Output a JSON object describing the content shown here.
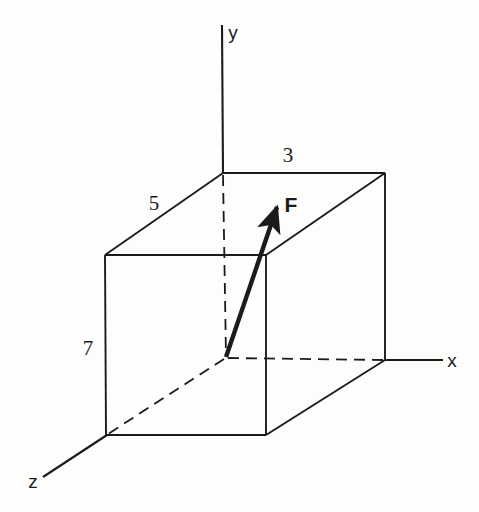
{
  "figure": {
    "kind": "engineering-line-drawing",
    "background_color": "#fdfdfc",
    "ink_color": "#1b1b1b",
    "width": 479,
    "height": 512
  },
  "axes": [
    {
      "id": "y",
      "label": "y",
      "label_x": 233,
      "label_y": 32,
      "direction": "up"
    },
    {
      "id": "x",
      "label": "x",
      "label_x": 452,
      "label_y": 360,
      "direction": "right"
    },
    {
      "id": "z",
      "label": "z",
      "label_x": 33,
      "label_y": 481,
      "direction": "down-left"
    }
  ],
  "dimensions": [
    {
      "id": "depth-z",
      "value": "5",
      "label_x": 154,
      "label_y": 203,
      "edge": "top-back-left-to-front-left"
    },
    {
      "id": "width-x",
      "value": "3",
      "label_x": 288,
      "label_y": 155,
      "edge": "top-back-left-to-back-right"
    },
    {
      "id": "height-y",
      "value": "7",
      "label_x": 88,
      "label_y": 348,
      "edge": "front-left-vertical"
    }
  ],
  "vector": {
    "id": "force-F",
    "label": "F",
    "label_x": 291,
    "label_y": 204,
    "tail_x": 226,
    "tail_y": 357,
    "tip_x": 280,
    "tip_y": 199
  },
  "geometry": {
    "vertices": {
      "origin": {
        "x": 226,
        "y": 358
      },
      "back_top_left": {
        "x": 223,
        "y": 173
      },
      "back_top_right": {
        "x": 385,
        "y": 173
      },
      "back_bottom_right": {
        "x": 385,
        "y": 360
      },
      "front_top_left": {
        "x": 105,
        "y": 255
      },
      "front_top_right": {
        "x": 266,
        "y": 255
      },
      "front_bottom_left": {
        "x": 106,
        "y": 435
      },
      "front_bottom_right": {
        "x": 266,
        "y": 435
      }
    },
    "axis_ends": {
      "y_axis_top": {
        "x": 222,
        "y": 25
      },
      "x_axis_right": {
        "x": 443,
        "y": 360
      },
      "z_axis_out": {
        "x": 43,
        "y": 477
      }
    },
    "solid_edges": [
      [
        "back_top_left",
        "back_top_right"
      ],
      [
        "back_top_left",
        "front_top_left"
      ],
      [
        "back_top_right",
        "front_top_right"
      ],
      [
        "back_top_right",
        "back_bottom_right"
      ],
      [
        "front_top_left",
        "front_top_right"
      ],
      [
        "front_top_left",
        "front_bottom_left"
      ],
      [
        "front_top_right",
        "front_bottom_right"
      ],
      [
        "front_bottom_left",
        "front_bottom_right"
      ],
      [
        "front_bottom_right",
        "back_bottom_right"
      ]
    ],
    "hidden_edges": [
      [
        "back_top_left",
        "origin"
      ],
      [
        "origin",
        "back_bottom_right"
      ],
      [
        "origin",
        "front_bottom_left"
      ]
    ]
  }
}
